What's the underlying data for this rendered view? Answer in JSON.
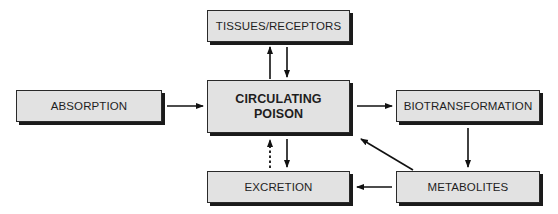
{
  "diagram": {
    "nodes": [
      {
        "id": "tissues",
        "label": "TISSUES/RECEPTORS"
      },
      {
        "id": "absorption",
        "label": "ABSORPTION"
      },
      {
        "id": "circulating",
        "label_line1": "CIRCULATING",
        "label_line2": "POISON"
      },
      {
        "id": "biotransformation",
        "label": "BIOTRANSFORMATION"
      },
      {
        "id": "excretion",
        "label": "EXCRETION"
      },
      {
        "id": "metabolites",
        "label": "METABOLITES"
      }
    ],
    "edges": [
      {
        "from": "absorption",
        "to": "circulating",
        "style": "solid"
      },
      {
        "from": "circulating",
        "to": "tissues",
        "style": "solid"
      },
      {
        "from": "tissues",
        "to": "circulating",
        "style": "solid"
      },
      {
        "from": "circulating",
        "to": "biotransformation",
        "style": "solid"
      },
      {
        "from": "biotransformation",
        "to": "metabolites",
        "style": "solid"
      },
      {
        "from": "metabolites",
        "to": "circulating",
        "style": "solid"
      },
      {
        "from": "metabolites",
        "to": "excretion",
        "style": "solid"
      },
      {
        "from": "circulating",
        "to": "excretion",
        "style": "solid"
      },
      {
        "from": "excretion",
        "to": "circulating",
        "style": "dotted"
      }
    ]
  }
}
